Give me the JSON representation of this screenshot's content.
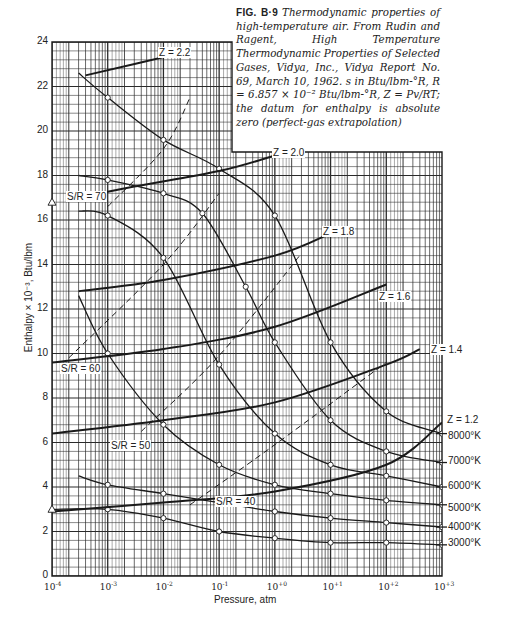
{
  "chart_data": {
    "type": "line",
    "caption": {
      "fig_label": "FIG. B·9",
      "text": "Thermodynamic properties of high-temperature air. From Rudin and Ragent, High Temperature Thermodynamic Properties of Selected Gases, Vidya, Inc., Vidya Report No. 69, March 10, 1962. s in Btu/lbm-°R, R = 6.857 × 10⁻² Btu/lbm-°R, Z = Pv/RT; the datum for enthalpy is absolute zero (perfect-gas extrapolation)"
    },
    "xlabel": "Pressure, atm",
    "ylabel": "Enthalpy × 10⁻³, Btu/lbm",
    "xscale": "log",
    "xlim": [
      0.0001,
      1000
    ],
    "ylim": [
      0,
      24
    ],
    "grid": true,
    "x_ticks": [
      {
        "base": "10",
        "exp": "-4"
      },
      {
        "base": "10",
        "exp": "-3"
      },
      {
        "base": "10",
        "exp": "-2"
      },
      {
        "base": "10",
        "exp": "-1"
      },
      {
        "base": "10",
        "exp": "+0"
      },
      {
        "base": "10",
        "exp": "+1"
      },
      {
        "base": "10",
        "exp": "+2"
      },
      {
        "base": "10",
        "exp": "+3"
      }
    ],
    "y_ticks": [
      "0",
      "2",
      "4",
      "6",
      "8",
      "10",
      "12",
      "14",
      "16",
      "18",
      "20",
      "22",
      "24"
    ],
    "isotherms": [
      {
        "name": "8000°K",
        "x": [
          0.0003,
          0.001,
          0.01,
          0.1,
          1,
          10,
          100,
          1000
        ],
        "y": [
          22.6,
          21.5,
          19.6,
          18.3,
          16.2,
          10.5,
          7.4,
          6.4
        ]
      },
      {
        "name": "7000°K",
        "x": [
          0.0003,
          0.001,
          0.01,
          0.05,
          0.3,
          1,
          10,
          100,
          1000
        ],
        "y": [
          18.0,
          17.8,
          17.2,
          16.3,
          13.0,
          10.5,
          7.0,
          5.6,
          5.1
        ]
      },
      {
        "name": "6000°K",
        "x": [
          0.0003,
          0.001,
          0.01,
          0.1,
          1,
          10,
          100,
          1000
        ],
        "y": [
          16.4,
          16.2,
          14.3,
          9.5,
          6.4,
          5.0,
          4.5,
          4.0
        ]
      },
      {
        "name": "5000°K",
        "x": [
          0.0003,
          0.001,
          0.01,
          0.1,
          1,
          10,
          100,
          1000
        ],
        "y": [
          12.6,
          10.0,
          6.8,
          5.0,
          4.1,
          3.7,
          3.4,
          3.2
        ]
      },
      {
        "name": "4000°K",
        "x": [
          0.0003,
          0.001,
          0.01,
          0.1,
          1,
          10,
          100,
          1000
        ],
        "y": [
          4.5,
          4.1,
          3.7,
          3.3,
          2.9,
          2.6,
          2.4,
          2.2
        ]
      },
      {
        "name": "3000°K",
        "x": [
          0.0001,
          0.001,
          0.01,
          0.1,
          1,
          10,
          100,
          1000
        ],
        "y": [
          3.0,
          3.0,
          2.6,
          2.0,
          1.7,
          1.5,
          1.5,
          1.4
        ]
      }
    ],
    "z_lines": [
      {
        "name": "Z = 2.2",
        "x": [
          0.0004,
          0.03
        ],
        "y": [
          22.5,
          23.6
        ]
      },
      {
        "name": "Z = 2.0",
        "x": [
          0.0003,
          0.003,
          0.1,
          1,
          3
        ],
        "y": [
          17.0,
          17.5,
          18.2,
          18.9,
          19.3
        ]
      },
      {
        "name": "Z = 1.8",
        "x": [
          0.0003,
          0.01,
          1,
          10
        ],
        "y": [
          12.8,
          13.3,
          14.4,
          15.4
        ]
      },
      {
        "name": "Z = 1.6",
        "x": [
          0.0001,
          0.01,
          1,
          100
        ],
        "y": [
          9.6,
          10.2,
          11.2,
          13.1
        ]
      },
      {
        "name": "Z = 1.4",
        "x": [
          0.0001,
          0.01,
          1,
          100,
          400
        ],
        "y": [
          6.4,
          7.0,
          7.8,
          9.5,
          10.2
        ]
      },
      {
        "name": "Z = 1.2",
        "x": [
          0.0001,
          0.01,
          1,
          100,
          1000
        ],
        "y": [
          2.9,
          3.3,
          3.8,
          5.0,
          6.9
        ]
      }
    ],
    "entropy_lines": [
      {
        "name": "S/R = 70",
        "x": [
          0.001,
          0.01,
          0.03
        ],
        "y": [
          16.6,
          19.2,
          21.5
        ],
        "style": "dashed"
      },
      {
        "name": "S/R = 60",
        "x": [
          0.0002,
          0.01,
          0.1
        ],
        "y": [
          9.8,
          14.0,
          17.2
        ],
        "style": "dashed"
      },
      {
        "name": "S/R = 50",
        "x": [
          0.004,
          0.1,
          3
        ],
        "y": [
          6.5,
          9.9,
          14.5
        ],
        "style": "dashed"
      },
      {
        "name": "S/R = 40",
        "x": [
          0.03,
          1,
          100
        ],
        "y": [
          3.2,
          5.9,
          9.6
        ],
        "style": "dashed"
      }
    ],
    "annotations": [
      "Z = 2.2",
      "Z = 2.0",
      "Z = 1.8",
      "Z = 1.6",
      "Z = 1.4",
      "Z = 1.2",
      "S/R = 70",
      "S/R = 60",
      "S/R = 50",
      "S/R = 40",
      "8000°K",
      "7000°K",
      "6000°K",
      "5000°K",
      "4000°K",
      "3000°K"
    ]
  },
  "labels": {
    "fig": "FIG. B·9",
    "caption": "Thermodynamic properties of high-temperature air. From Rudin and Ragent, High Temperature Thermodynamic Properties of Selected Gases, Vidya, Inc., Vidya Report No. 69, March 10, 1962. s in Btu/lbm-°R, R = 6.857 × 10⁻² Btu/lbm-°R, Z = Pv/RT; the datum for enthalpy is absolute zero (perfect-gas extrapolation)",
    "xlabel": "Pressure, atm",
    "ylabel": "Enthalpy × 10⁻³, Btu/lbm",
    "temps": [
      "8000°K",
      "7000°K",
      "6000°K",
      "5000°K",
      "4000°K",
      "3000°K"
    ],
    "z": [
      "Z = 2.2",
      "Z = 2.0",
      "Z = 1.8",
      "Z = 1.6",
      "Z = 1.4",
      "Z = 1.2"
    ],
    "s": [
      "S/R = 70",
      "S/R = 60",
      "S/R = 50",
      "S/R = 40"
    ]
  },
  "colors": {
    "ink": "#1a1a1a",
    "grid": "#2a2a2a",
    "paper": "#ffffff"
  }
}
